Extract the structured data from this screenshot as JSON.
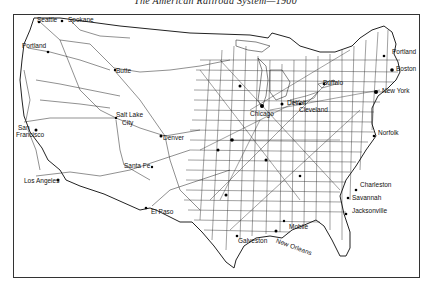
{
  "map": {
    "title": "The American Railroad System—1900",
    "cities": [
      {
        "name": "Seattle",
        "x": 37,
        "y": 18
      },
      {
        "name": "Spokane",
        "x": 66,
        "y": 17
      },
      {
        "name": "Portland",
        "x": 23,
        "y": 46
      },
      {
        "name": "Butte",
        "x": 115,
        "y": 71
      },
      {
        "name": "Salt Lake City",
        "label": "Salt Lake",
        "label2": "City",
        "x": 116,
        "y": 117
      },
      {
        "name": "San Francisco",
        "label": "San",
        "label2": "Francisco",
        "x": 16,
        "y": 124
      },
      {
        "name": "Denver",
        "x": 163,
        "y": 136
      },
      {
        "name": "Santa Fe",
        "x": 122,
        "y": 163
      },
      {
        "name": "Los Angeles",
        "x": 24,
        "y": 178
      },
      {
        "name": "El Paso",
        "x": 150,
        "y": 210
      },
      {
        "name": "Galveston",
        "x": 237,
        "y": 239
      },
      {
        "name": "New Orleans",
        "x": 276,
        "y": 243
      },
      {
        "name": "Mobile",
        "x": 287,
        "y": 226
      },
      {
        "name": "Chicago",
        "x": 254,
        "y": 115
      },
      {
        "name": "Detroit",
        "x": 286,
        "y": 106
      },
      {
        "name": "Cleveland",
        "x": 302,
        "y": 107
      },
      {
        "name": "Buffalo",
        "x": 323,
        "y": 81
      },
      {
        "name": "Portland",
        "x": 392,
        "y": 52
      },
      {
        "name": "Boston",
        "x": 394,
        "y": 67
      },
      {
        "name": "New York",
        "x": 382,
        "y": 90
      },
      {
        "name": "Norfolk",
        "x": 378,
        "y": 131
      },
      {
        "name": "Charleston",
        "x": 359,
        "y": 184
      },
      {
        "name": "Savannah",
        "x": 351,
        "y": 196
      },
      {
        "name": "Jacksonville",
        "x": 352,
        "y": 209
      }
    ]
  }
}
